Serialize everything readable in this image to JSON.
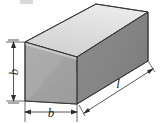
{
  "figure": {
    "kind": "three-dimensional-rectangular-prism-dimension-diagram",
    "background_color": "#ffffff",
    "line_color": "#2b2b2b",
    "labels": {
      "height": "b",
      "width": "b",
      "length": "l"
    },
    "faces": {
      "top_face_color": "#d9d9d9",
      "top_face_highlight_color": "#e8e8e8",
      "front_face_color": "#a9a9a9",
      "front_face_shade_color": "#9e9e9e",
      "side_face_color": "#858585",
      "side_face_shade_color": "#7c7c7c",
      "edge_color": "#3a3a3a"
    },
    "dimensions": [
      {
        "name": "height-dimension",
        "label": "b",
        "orientation": "vertical",
        "position": "left"
      },
      {
        "name": "width-dimension",
        "label": "b",
        "orientation": "horizontal",
        "position": "bottom"
      },
      {
        "name": "length-dimension",
        "label": "l",
        "orientation": "oblique",
        "position": "bottom-right"
      }
    ]
  }
}
